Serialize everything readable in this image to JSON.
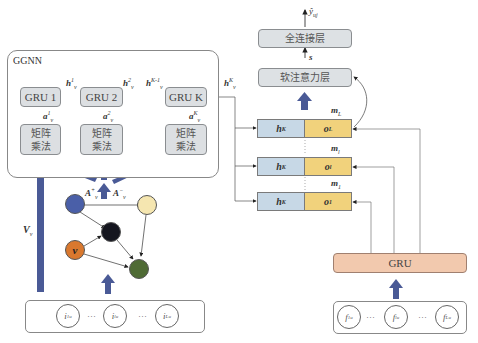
{
  "ggnn": {
    "title": "GGNN",
    "gru_cells": [
      {
        "label": "GRU 1",
        "hidden": "h",
        "hidden_sup": "1",
        "hidden_sub": "v",
        "input": "a",
        "input_sup": "1",
        "input_sub": "v"
      },
      {
        "label": "GRU 2",
        "hidden": "h",
        "hidden_sup": "2",
        "hidden_sub": "v",
        "input": "a",
        "input_sup": "2",
        "input_sub": "v"
      },
      {
        "label": "GRU K",
        "hidden": "h",
        "hidden_sup": "K-1",
        "hidden_sub": "v",
        "input": "a",
        "input_sup": "K",
        "input_sub": "v"
      }
    ],
    "matmul_label_line1": "矩阵",
    "matmul_label_line2": "乘法",
    "output_hidden": {
      "base": "h",
      "sup": "K",
      "sub": "v"
    },
    "ellipsis": "···"
  },
  "graph": {
    "adj_in": {
      "base": "A",
      "sup": "+",
      "sub": "v"
    },
    "adj_out": {
      "base": "A",
      "sup": "−",
      "sub": "v"
    },
    "item_emb": {
      "base": "V",
      "sub": "v"
    },
    "nodes": [
      {
        "id": "n1",
        "color": "#4a5fa8",
        "label": ""
      },
      {
        "id": "n2",
        "color": "#f5e6b0",
        "label": ""
      },
      {
        "id": "n3",
        "color": "#15161f",
        "label": ""
      },
      {
        "id": "n4",
        "color": "#d9782e",
        "label": "v"
      },
      {
        "id": "n5",
        "color": "#4f6b35",
        "label": ""
      }
    ]
  },
  "item_sequence": {
    "items": [
      {
        "base": "i",
        "sup": "1",
        "sub": "u"
      },
      {
        "base": "i",
        "sup": "l",
        "sub": "u"
      },
      {
        "base": "i",
        "sup": "L",
        "sub": "u"
      }
    ],
    "ellipsis": "···"
  },
  "feature_sequence": {
    "items": [
      {
        "base": "f",
        "sup": "1",
        "sub": "u"
      },
      {
        "base": "f",
        "sup": "l",
        "sub": "u"
      },
      {
        "base": "f",
        "sup": "L",
        "sub": "u"
      }
    ],
    "ellipsis": "···"
  },
  "right": {
    "output": {
      "base": "ŷ",
      "sub": "uj"
    },
    "fc_layer": "全连接层",
    "s_label": "s",
    "attention_layer": "软注意力层",
    "gru_label": "GRU",
    "memory_rows": [
      {
        "m": "m",
        "m_sub": "L",
        "h": "h",
        "h_sup": "K",
        "h_sub": "i_u",
        "o": "o",
        "o_sub": "L"
      },
      {
        "m": "m",
        "m_sub": "l",
        "h": "h",
        "h_sup": "K",
        "h_sub": "i_u",
        "o": "o",
        "o_sub": "l"
      },
      {
        "m": "m",
        "m_sub": "1",
        "h": "h",
        "h_sup": "K",
        "h_sub": "i_u",
        "o": "o",
        "o_sub": "1"
      }
    ]
  },
  "colors": {
    "arrow_blue": "#4a5a96",
    "h_cell": "#c7d8e6",
    "o_cell": "#f1d27c",
    "gru_bottom": "#f2c9ae",
    "box_gray": "#dcdfe2"
  }
}
